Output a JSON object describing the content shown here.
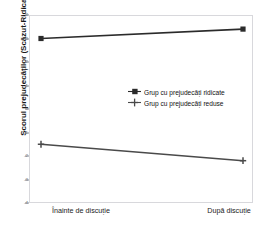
{
  "figure": {
    "top_fragment_left": "",
    "top_fragment_right": ""
  },
  "axis": {
    "ylabel": "Scorul prejudecăților (Scăzut-Ridicat)",
    "ytick_labels": [
      "4",
      "3",
      "2",
      "1",
      "0",
      "-1",
      "-2",
      "-3",
      "-4"
    ],
    "xtick_labels": [
      "Înainte de discuție",
      "După discuție"
    ]
  },
  "legend": {
    "items": [
      {
        "label": "Grup cu prejudecăți ridicate",
        "marker": "filled-square-marker",
        "color": "#2b2b2b"
      },
      {
        "label": "Grup cu prejudecăți reduse",
        "marker": "plus-marker",
        "color": "#4a4a4a"
      }
    ]
  },
  "chart_data": {
    "type": "line",
    "title": "",
    "xlabel": "",
    "ylabel": "Scorul prejudecăților (Scăzut-Ridicat)",
    "categories": [
      "Înainte de discuție",
      "După discuție"
    ],
    "ylim": [
      -4,
      4
    ],
    "yticks": [
      4,
      3,
      2,
      1,
      0,
      -1,
      -2,
      -3,
      -4
    ],
    "grid": false,
    "legend_position": "center-right",
    "series": [
      {
        "name": "Grup cu prejudecăți ridicate",
        "values": [
          3.0,
          3.4
        ],
        "color": "#2b2b2b",
        "marker": "square"
      },
      {
        "name": "Grup cu prejudecăți reduse",
        "values": [
          -1.5,
          -2.2
        ],
        "color": "#4a4a4a",
        "marker": "plus"
      }
    ]
  }
}
